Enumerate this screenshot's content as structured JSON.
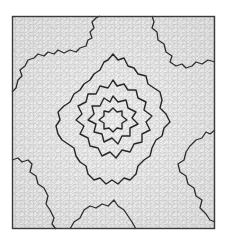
{
  "figure": {
    "colors": {
      "background": "#ffffff",
      "frame": "#3a3a3a",
      "cell_fill": "#ececec",
      "cell_edge": "#b4b4b4",
      "contour": "#2a2a2a"
    },
    "frame": {
      "x": 12,
      "y": 16,
      "width": 203,
      "height": 213
    },
    "center": {
      "x": 113,
      "y": 120
    },
    "star_rings": [
      {
        "name": "ring-1",
        "radius_outer": 12,
        "radius_inner": 7,
        "points": 6
      },
      {
        "name": "ring-2",
        "radius_outer": 24,
        "radius_inner": 15,
        "points": 6
      },
      {
        "name": "ring-3",
        "radius_outer": 42,
        "radius_inner": 28,
        "points": 6
      },
      {
        "name": "ring-4",
        "radius_outer": 72,
        "radius_inner": 46,
        "points": 5
      }
    ]
  }
}
